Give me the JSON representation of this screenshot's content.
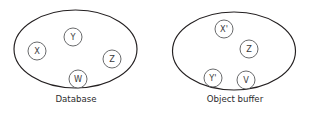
{
  "diagram": {
    "background_color": "#ffffff",
    "ellipse_stroke_color": "#231f20",
    "node_stroke_color": "#58595b",
    "text_color": "#2b2b2d",
    "groups": [
      {
        "id": "database",
        "caption": "Database",
        "caption_x": 76,
        "caption_y": 99,
        "ellipse": {
          "cx": 75.5,
          "cy": 49,
          "rx": 61.5,
          "ry": 39
        },
        "nodes": [
          {
            "id": "db-node-x",
            "label": "X",
            "cx": 37,
            "cy": 51,
            "r": 9
          },
          {
            "id": "db-node-y",
            "label": "Y",
            "cx": 73,
            "cy": 37,
            "r": 9
          },
          {
            "id": "db-node-z",
            "label": "Z",
            "cx": 112,
            "cy": 59,
            "r": 9
          },
          {
            "id": "db-node-w",
            "label": "W",
            "cx": 78,
            "cy": 79,
            "r": 9
          }
        ]
      },
      {
        "id": "object-buffer",
        "caption": "Object buffer",
        "caption_x": 235,
        "caption_y": 99,
        "ellipse": {
          "cx": 234,
          "cy": 51,
          "rx": 61.5,
          "ry": 39
        },
        "nodes": [
          {
            "id": "ob-node-x-prime",
            "label": "X'",
            "cx": 224,
            "cy": 29,
            "r": 9
          },
          {
            "id": "ob-node-z",
            "label": "Z",
            "cx": 249,
            "cy": 49,
            "r": 9
          },
          {
            "id": "ob-node-y-prime",
            "label": "Y'",
            "cx": 213,
            "cy": 78,
            "r": 9
          },
          {
            "id": "ob-node-v",
            "label": "V",
            "cx": 246,
            "cy": 80,
            "r": 9
          }
        ]
      }
    ]
  }
}
